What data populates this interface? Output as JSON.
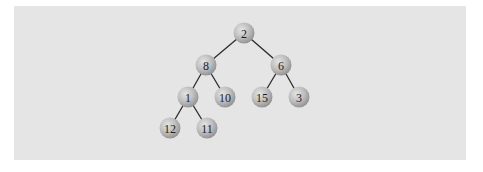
{
  "figure": {
    "type": "binary-tree",
    "background_color": "#e5e5e5",
    "node_color": "#b4b4b4",
    "edge_color": "#2a2a2a"
  },
  "nodes": [
    {
      "id": "n0",
      "label": "2",
      "x": 244,
      "y": 33
    },
    {
      "id": "n1",
      "label": "8",
      "x": 206,
      "y": 65
    },
    {
      "id": "n2",
      "label": "6",
      "x": 281,
      "y": 65
    },
    {
      "id": "n3",
      "label": "1",
      "x": 188,
      "y": 97
    },
    {
      "id": "n4",
      "label": "10",
      "x": 225,
      "y": 97
    },
    {
      "id": "n5",
      "label": "15",
      "x": 262,
      "y": 97
    },
    {
      "id": "n6",
      "label": "3",
      "x": 299,
      "y": 97
    },
    {
      "id": "n7",
      "label": "12",
      "x": 170,
      "y": 128
    },
    {
      "id": "n8",
      "label": "11",
      "x": 207,
      "y": 128
    }
  ],
  "edges": [
    {
      "from": "n0",
      "to": "n1"
    },
    {
      "from": "n0",
      "to": "n2"
    },
    {
      "from": "n1",
      "to": "n3"
    },
    {
      "from": "n1",
      "to": "n4"
    },
    {
      "from": "n2",
      "to": "n5"
    },
    {
      "from": "n2",
      "to": "n6"
    },
    {
      "from": "n3",
      "to": "n7"
    },
    {
      "from": "n3",
      "to": "n8"
    }
  ]
}
